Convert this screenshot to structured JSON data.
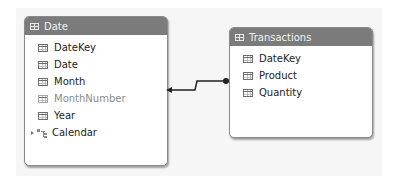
{
  "diagram": {
    "tables": [
      {
        "name": "Date",
        "fields": [
          {
            "label": "DateKey",
            "hidden": false
          },
          {
            "label": "Date",
            "hidden": false
          },
          {
            "label": "Month",
            "hidden": false
          },
          {
            "label": "MonthNumber",
            "hidden": true
          },
          {
            "label": "Year",
            "hidden": false
          }
        ],
        "hierarchies": [
          {
            "label": "Calendar",
            "collapsed": true
          }
        ]
      },
      {
        "name": "Transactions",
        "fields": [
          {
            "label": "DateKey",
            "hidden": false
          },
          {
            "label": "Product",
            "hidden": false
          },
          {
            "label": "Quantity",
            "hidden": false
          }
        ]
      }
    ],
    "relationships": [
      {
        "from_table": "Transactions",
        "from_end": "many",
        "to_table": "Date",
        "to_end": "one-arrow"
      }
    ],
    "colors": {
      "header_bg": "#7b7b7b",
      "header_text": "#f2f2f2",
      "field_text": "#222222",
      "hidden_field_text": "#8a8a8a",
      "connector": "#222222"
    }
  }
}
